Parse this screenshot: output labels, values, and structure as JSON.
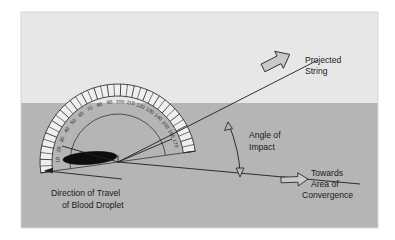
{
  "figure": {
    "colors": {
      "page_background": "#ffffff",
      "upper_band": "#e6e6e6",
      "lower_band": "#b4b4b4",
      "droplet_fill": "#0d0d0d",
      "line_stroke": "#1e1e1e",
      "arrow_fill": "#c9c9c9",
      "frame_border": "#d2d2d2"
    },
    "bands": {
      "upper_label": "light-gray-background-band",
      "lower_label": "dark-gray-surface-band",
      "horizon_y": 103
    }
  },
  "protractor": {
    "name": "semicircular-protractor",
    "center": {
      "x": 118,
      "y": 162
    },
    "outer_radius": 78,
    "inner_radius": 66,
    "arc_radius": 48,
    "degree_labels": [
      "170",
      "160",
      "150",
      "140",
      "130",
      "120",
      "110",
      "100",
      "90",
      "80",
      "70",
      "60",
      "50",
      "40",
      "30",
      "20",
      "10"
    ],
    "degree_values": [
      170,
      160,
      150,
      140,
      130,
      120,
      110,
      100,
      90,
      80,
      70,
      60,
      50,
      40,
      30,
      20,
      10
    ],
    "minor_tick_step_degrees": 5
  },
  "droplet": {
    "name": "blood-droplet-ellipse",
    "center": {
      "x": 90,
      "y": 158
    },
    "rx": 27,
    "ry": 6.2,
    "rotation_deg": -4
  },
  "rays": {
    "projected_string_ray": {
      "from": {
        "x": 118,
        "y": 162
      },
      "to": {
        "x": 312,
        "y": 63
      }
    },
    "convergence_ray": {
      "from": {
        "x": 118,
        "y": 162
      },
      "to": {
        "x": 352,
        "y": 183
      }
    },
    "minor_axis_ray": {
      "from": {
        "x": 118,
        "y": 162
      },
      "to": {
        "x": 63,
        "y": 146
      }
    },
    "protractor_edge_ray": {
      "from": {
        "x": 118,
        "y": 162
      },
      "to": {
        "x": 168,
        "y": 142
      }
    },
    "travel_arrow": {
      "from": {
        "x": 122,
        "y": 177
      },
      "to": {
        "x": 44,
        "y": 170
      }
    }
  },
  "labels": {
    "projected_string": {
      "line1": "Projected",
      "line2": "String"
    },
    "angle_of_impact": {
      "line1": "Angle of",
      "line2": "Impact"
    },
    "towards_convergence": {
      "line1": "Towards",
      "line2": "Area of",
      "line3": "Convergence"
    },
    "direction_of_travel": {
      "line1": "Direction of Travel",
      "line2": "of Blood Droplet"
    }
  },
  "arrows": {
    "projected_string_arrow": "block-arrow-up-right",
    "convergence_arrow": "block-arrow-right",
    "angle_arc_arrow": "double-headed-arc-arrow",
    "travel_arrow": "thin-arrow-left"
  }
}
